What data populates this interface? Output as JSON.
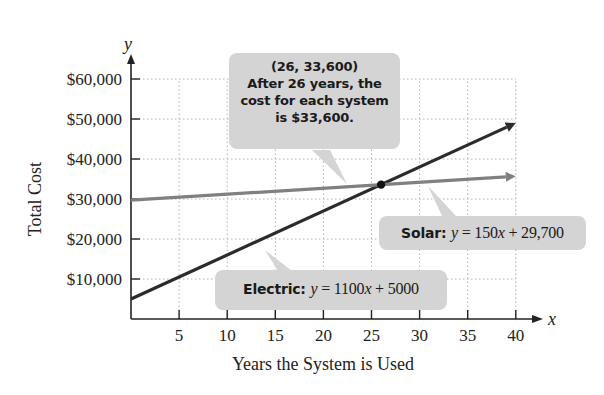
{
  "chart_data": {
    "type": "line",
    "title": "",
    "xlabel": "Years the System is Used",
    "ylabel": "Total Cost",
    "x_axis_var": "x",
    "y_axis_var": "y",
    "xlim": [
      0,
      40
    ],
    "ylim": [
      0,
      60000
    ],
    "x_ticks": [
      5,
      10,
      15,
      20,
      25,
      30,
      35,
      40
    ],
    "x_tick_labels": [
      "5",
      "10",
      "15",
      "20",
      "25",
      "30",
      "35",
      "40"
    ],
    "y_ticks": [
      10000,
      20000,
      30000,
      40000,
      50000,
      60000
    ],
    "y_tick_labels": [
      "$10,000",
      "$20,000",
      "$30,000",
      "$40,000",
      "$50,000",
      "$60,000"
    ],
    "grid": true,
    "series": [
      {
        "name": "Electric",
        "equation": "y = 1100x + 5000",
        "slope": 1100,
        "intercept": 5000,
        "x": [
          0,
          40
        ],
        "values": [
          5000,
          49000
        ],
        "color": "#2b2b2b"
      },
      {
        "name": "Solar",
        "equation": "y = 150x + 29,700",
        "slope": 150,
        "intercept": 29700,
        "x": [
          0,
          40
        ],
        "values": [
          29700,
          35700
        ],
        "color": "#808080"
      }
    ],
    "intersection": {
      "x": 26,
      "y": 33600,
      "label": "(26, 33,600)"
    },
    "annotations": [
      {
        "id": "intersection",
        "lines": [
          "(26, 33,600)",
          "After 26 years, the",
          "cost for each system",
          "is $33,600."
        ]
      },
      {
        "id": "solar",
        "prefix": "Solar:",
        "equation": "y = 150x + 29,700"
      },
      {
        "id": "electric",
        "prefix": "Electric:",
        "equation": "y = 1100x + 5000"
      }
    ]
  },
  "labels": {
    "x_title": "Years the System is Used",
    "y_title": "Total Cost",
    "x_var": "x",
    "y_var": "y",
    "callout_intersection": {
      "line1": "(26, 33,600)",
      "line2": "After 26 years, the",
      "line3": "cost for each system",
      "line4": "is $33,600."
    },
    "callout_solar": {
      "prefix": "Solar:",
      "var": "y",
      "eq_mid": " = 150",
      "var2": "x",
      "eq_end": " + 29,700"
    },
    "callout_electric": {
      "prefix": "Electric:",
      "var": "y",
      "eq_mid": " = 1100",
      "var2": "x",
      "eq_end": " + 5000"
    }
  },
  "colors": {
    "electric_line": "#2b2b2b",
    "solar_line": "#808080",
    "callout_bg": "#d4d4d4",
    "grid": "#b0b0b0",
    "axis": "#222222"
  }
}
